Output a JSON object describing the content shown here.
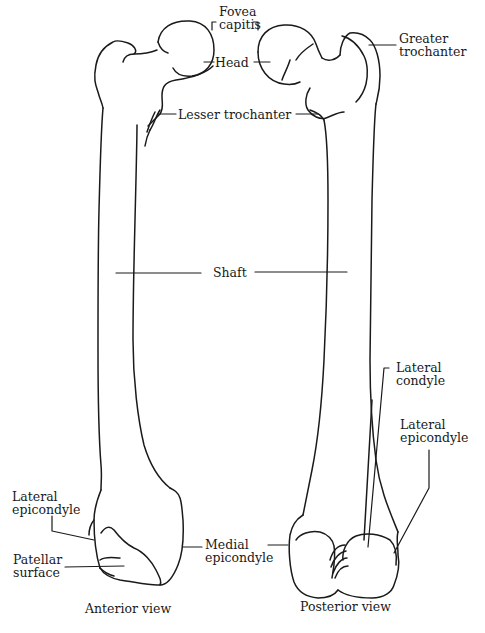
{
  "diagram": {
    "line_color": "#1a1a1a",
    "background": "#ffffff",
    "labels": {
      "fovea_capitis": "Fovea\ncapitis",
      "head": "Head",
      "greater_trochanter": "Greater\ntrochanter",
      "lesser_trochanter": "Lesser trochanter",
      "shaft": "Shaft",
      "lateral_condyle": "Lateral\ncondyle",
      "lateral_epicondyle_posterior": "Lateral\nepicondyle",
      "lateral_epicondyle_anterior": "Lateral\nepicondyle",
      "medial_epicondyle": "Medial\nepicondyle",
      "patellar_surface": "Patellar\nsurface"
    },
    "captions": {
      "anterior": "Anterior view",
      "posterior": "Posterior view"
    }
  }
}
